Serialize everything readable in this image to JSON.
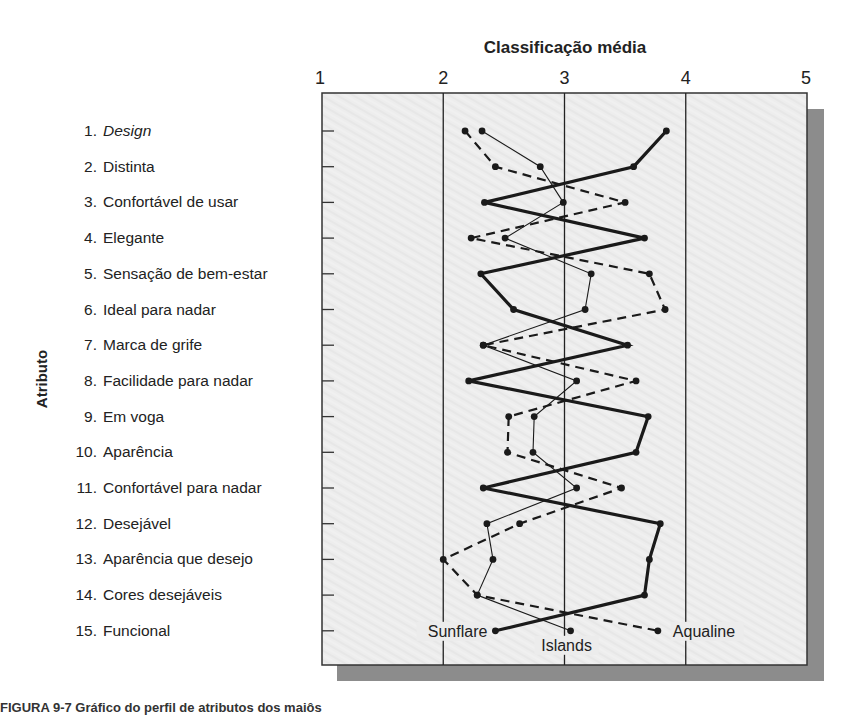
{
  "chart_data": {
    "type": "line",
    "title": "Classificação média",
    "xlabel": "Classificação média",
    "ylabel": "Atributo",
    "xlim": [
      1,
      5
    ],
    "x_ticks": [
      "1",
      "2",
      "3",
      "4",
      "5"
    ],
    "grid": true,
    "grid_lines_at": [
      2,
      3,
      4
    ],
    "orientation": "horizontal profile (attributes on vertical axis, rating on horizontal axis)",
    "categories": [
      "1. Design",
      "2. Distinta",
      "3. Confortável de usar",
      "4. Elegante",
      "5. Sensação de bem-estar",
      "6. Ideal para nadar",
      "7. Marca de grife",
      "8. Facilidade para nadar",
      "9. Em voga",
      "10. Aparência",
      "11. Confortável para nadar",
      "12. Desejável",
      "13. Aparência que desejo",
      "14. Cores desejáveis",
      "15. Funcional"
    ],
    "category_numbers": [
      "1.",
      "2.",
      "3.",
      "4.",
      "5.",
      "6.",
      "7.",
      "8.",
      "9.",
      "10.",
      "11.",
      "12.",
      "13.",
      "14.",
      "15."
    ],
    "category_names": [
      "Design",
      "Distinta",
      "Confortável de usar",
      "Elegante",
      "Sensação de bem-estar",
      "Ideal para nadar",
      "Marca de grife",
      "Facilidade para nadar",
      "Em voga",
      "Aparência",
      "Confortável para nadar",
      "Desejável",
      "Aparência que desejo",
      "Cores desejáveis",
      "Funcional"
    ],
    "series": [
      {
        "name": "Sunflare",
        "style": "thick-solid",
        "values": [
          3.84,
          3.57,
          2.34,
          3.66,
          2.31,
          2.58,
          3.52,
          2.21,
          3.69,
          3.59,
          2.33,
          3.79,
          3.7,
          3.66,
          2.43
        ]
      },
      {
        "name": "Islands",
        "style": "thin-solid",
        "values": [
          2.32,
          2.8,
          2.99,
          2.51,
          3.22,
          3.17,
          2.33,
          3.1,
          2.75,
          2.74,
          3.1,
          2.36,
          2.41,
          2.28,
          3.05
        ]
      },
      {
        "name": "Aqualine",
        "style": "dashed",
        "values": [
          2.18,
          2.43,
          3.5,
          2.23,
          3.7,
          3.83,
          2.33,
          3.59,
          2.54,
          2.53,
          3.47,
          2.63,
          2.0,
          2.28,
          3.77
        ]
      }
    ],
    "legend": "inline labels at bottom of each line (Sunflare, Islands, Aqualine)"
  },
  "caption": "FIGURA 9-7  Gráfico do perfil de atributos dos maiôs"
}
